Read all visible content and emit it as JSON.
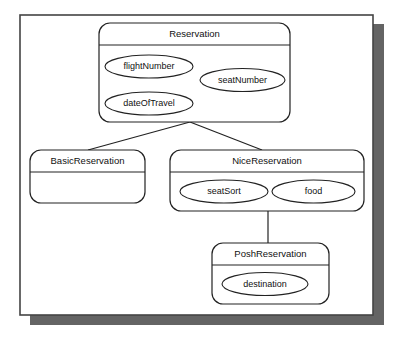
{
  "diagram": {
    "type": "uml-class-diagram",
    "style": {
      "line_color": "#222222",
      "box_fill": "#ffffff",
      "frame_stroke": "#444444",
      "shadow_color": "#646464",
      "page_background": "#ffffff"
    },
    "classes": [
      {
        "id": "reservation",
        "name": "Reservation",
        "attributes": [
          "flightNumber",
          "seatNumber",
          "dateOfTravel"
        ]
      },
      {
        "id": "basic-reservation",
        "name": "BasicReservation",
        "attributes": []
      },
      {
        "id": "nice-reservation",
        "name": "NiceReservation",
        "attributes": [
          "seatSort",
          "food"
        ]
      },
      {
        "id": "posh-reservation",
        "name": "PoshReservation",
        "attributes": [
          "destination"
        ]
      }
    ],
    "generalizations": [
      {
        "parent": "Reservation",
        "child": "BasicReservation"
      },
      {
        "parent": "Reservation",
        "child": "NiceReservation"
      },
      {
        "parent": "NiceReservation",
        "child": "PoshReservation"
      }
    ]
  }
}
